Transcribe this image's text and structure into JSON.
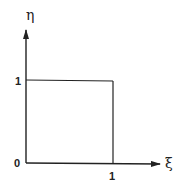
{
  "diagram": {
    "axes": {
      "x_label": "ξ",
      "y_label": "η",
      "origin_label": "0"
    },
    "ticks": {
      "x_tick_label": "1",
      "y_tick_label": "1"
    },
    "shape": {
      "type": "unit-square",
      "corners": [
        [
          0,
          0
        ],
        [
          1,
          0
        ],
        [
          1,
          1
        ],
        [
          0,
          1
        ]
      ]
    },
    "line_color": "#222222"
  }
}
